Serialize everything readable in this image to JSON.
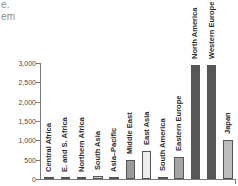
{
  "page_fragments": {
    "line1": "e.",
    "line2": "em"
  },
  "chart_data": {
    "type": "bar",
    "title": "",
    "subtitle": "",
    "xlabel": "",
    "ylabel": "",
    "ylim": [
      0,
      3000
    ],
    "grid": false,
    "legend": "none",
    "y_ticks": [
      "0",
      "500",
      "1,000",
      "1,500",
      "2,000",
      "2,500",
      "3,000"
    ],
    "y_tick_values": [
      0,
      500,
      1000,
      1500,
      2000,
      2500,
      3000
    ],
    "categories": [
      "Central Africa",
      "E. and S. Africa",
      "Northern Africa",
      "South Asia",
      "Asia–Pacific",
      "Middle East",
      "East Asia",
      "South America",
      "Eastern Europe",
      "North America",
      "Western Europe",
      "Japan"
    ],
    "values": [
      5,
      30,
      15,
      70,
      5,
      500,
      720,
      60,
      580,
      2950,
      2950,
      1000
    ],
    "bar_colors": [
      "#b5b5b5",
      "#b5b5b5",
      "#b5b5b5",
      "#cfcfcf",
      "#b5b5b5",
      "#9a9a9a",
      "#eeeeee",
      "#c6c6c6",
      "#a5a5a5",
      "#575757",
      "#575757",
      "#bdbdbd"
    ],
    "bar_border": "#555555"
  },
  "colors": {
    "axis": "#7a7a7a",
    "tick_text": "#4a4a4a",
    "label_text": "#2a2a2a",
    "background": "#ffffff",
    "fragment_text": "#8d8d8d"
  }
}
